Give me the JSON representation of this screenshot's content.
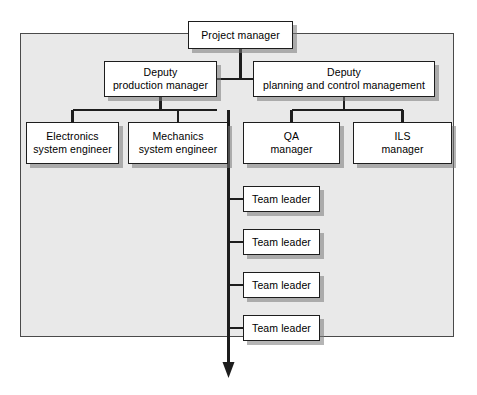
{
  "diagram": {
    "panel": {
      "fill": "#e9e9e9",
      "border": "#4a4a4a"
    },
    "node_style": {
      "fill": "#ffffff",
      "border": "#1d1d1d",
      "shadow": "#787878"
    },
    "line_color": "#1d1d1d"
  },
  "nodes": {
    "project_manager": {
      "line1": "Project manager",
      "line2": ""
    },
    "deputy_production": {
      "line1": "Deputy",
      "line2": "production manager"
    },
    "deputy_planning": {
      "line1": "Deputy",
      "line2": "planning and control management"
    },
    "electronics": {
      "line1": "Electronics",
      "line2": "system engineer"
    },
    "mechanics": {
      "line1": "Mechanics",
      "line2": "system engineer"
    },
    "qa": {
      "line1": "QA",
      "line2": "manager"
    },
    "ils": {
      "line1": "ILS",
      "line2": "manager"
    },
    "team_leaders": [
      {
        "line1": "Team leader",
        "line2": ""
      },
      {
        "line1": "Team leader",
        "line2": ""
      },
      {
        "line1": "Team leader",
        "line2": ""
      },
      {
        "line1": "Team leader",
        "line2": ""
      }
    ]
  }
}
